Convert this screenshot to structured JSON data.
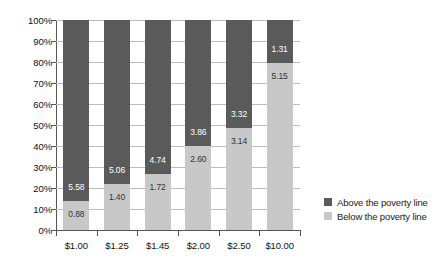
{
  "chart_data": {
    "type": "bar",
    "subtype": "stacked-100-percent",
    "title": "",
    "xlabel": "",
    "ylabel": "",
    "categories": [
      "$1.00",
      "$1.25",
      "$1.45",
      "$2.00",
      "$2.50",
      "$10.00"
    ],
    "series": [
      {
        "name": "Above the poverty line",
        "color": "#5a5a5a",
        "values": [
          5.58,
          5.06,
          4.74,
          3.86,
          3.32,
          1.31
        ],
        "labels": [
          "5.58",
          "5.06",
          "4.74",
          "3.86",
          "3.32",
          "1.31"
        ],
        "percents": [
          86.4,
          78.3,
          73.4,
          59.8,
          51.4,
          20.3
        ]
      },
      {
        "name": "Below the poverty line",
        "color": "#c8c8c8",
        "values": [
          0.88,
          1.4,
          1.72,
          2.6,
          3.14,
          5.15
        ],
        "labels": [
          "0.88",
          "1.40",
          "1.72",
          "2.60",
          "3.14",
          "5.15"
        ],
        "percents": [
          13.6,
          21.7,
          26.6,
          40.2,
          48.6,
          79.7
        ]
      }
    ],
    "ylim": [
      0,
      100
    ],
    "yticks": [
      "0%",
      "10%",
      "20%",
      "30%",
      "40%",
      "50%",
      "60%",
      "70%",
      "80%",
      "90%",
      "100%"
    ],
    "ytick_values": [
      0,
      10,
      20,
      30,
      40,
      50,
      60,
      70,
      80,
      90,
      100
    ],
    "grid": true,
    "grid_axis": "y",
    "legend_position": "right"
  },
  "legend": {
    "items": [
      {
        "label": "Above the poverty line",
        "color": "#5a5a5a"
      },
      {
        "label": "Below the poverty line",
        "color": "#c8c8c8"
      }
    ]
  },
  "colors": {
    "above": "#5a5a5a",
    "below": "#c8c8c8",
    "grid": "#bdbdbd",
    "axis": "#555555",
    "text": "#111111",
    "background": "#ffffff"
  }
}
